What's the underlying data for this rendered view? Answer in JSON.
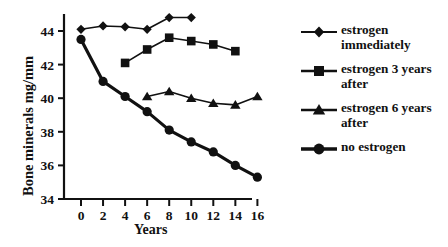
{
  "chart_data": {
    "type": "line",
    "title": "",
    "xlabel": "Years",
    "ylabel": "Bone minerals mg/mm",
    "xlim": [
      -1,
      17
    ],
    "ylim": [
      34,
      45
    ],
    "xticks": [
      0,
      2,
      4,
      6,
      8,
      10,
      12,
      14,
      16
    ],
    "yticks": [
      34,
      36,
      38,
      40,
      42,
      44
    ],
    "grid": false,
    "legend_position": "right",
    "series": [
      {
        "name": "estrogen immediately",
        "legend_label": "estrogen\nimmediately",
        "marker": "diamond",
        "line_width": 1.6,
        "color": "#111111",
        "x": [
          0,
          2,
          4,
          6,
          8,
          10
        ],
        "y": [
          44.1,
          44.3,
          44.25,
          44.1,
          44.8,
          44.8
        ]
      },
      {
        "name": "estrogen 3 years after",
        "legend_label": "estrogen 3 years\nafter",
        "marker": "square",
        "line_width": 1.6,
        "color": "#111111",
        "x": [
          4,
          6,
          8,
          10,
          12,
          14
        ],
        "y": [
          42.1,
          42.9,
          43.6,
          43.4,
          43.2,
          42.8
        ]
      },
      {
        "name": "estrogen 6 years after",
        "legend_label": "estrogen 6 years\nafter",
        "marker": "triangle",
        "line_width": 1.6,
        "color": "#111111",
        "x": [
          6,
          8,
          10,
          12,
          14,
          16
        ],
        "y": [
          40.1,
          40.4,
          40.0,
          39.7,
          39.6,
          40.1
        ]
      },
      {
        "name": "no estrogen",
        "legend_label": "no estrogen",
        "marker": "circle",
        "line_width": 3.2,
        "color": "#111111",
        "x": [
          0,
          2,
          4,
          6,
          8,
          10,
          12,
          14,
          16
        ],
        "y": [
          43.5,
          41.0,
          40.1,
          39.2,
          38.1,
          37.4,
          36.8,
          36.0,
          35.3
        ]
      }
    ]
  },
  "axes": {
    "y_title": "Bone minerals mg/mm",
    "x_title": "Years"
  },
  "legend": {
    "entries": [
      {
        "label": "estrogen\nimmediately",
        "marker": "diamond-marker-icon"
      },
      {
        "label": "estrogen 3 years\nafter",
        "marker": "square-marker-icon"
      },
      {
        "label": "estrogen 6 years\nafter",
        "marker": "triangle-marker-icon"
      },
      {
        "label": "no estrogen",
        "marker": "circle-marker-icon"
      }
    ]
  }
}
